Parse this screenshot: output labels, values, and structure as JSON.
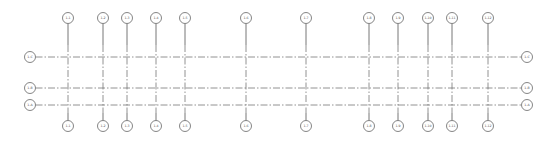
{
  "diagram": {
    "type": "structural-grid-plan",
    "colors": {
      "line": "#777777",
      "bubble_stroke": "#666666",
      "text": "#555555",
      "background": "#ffffff"
    },
    "vertical_grids": [
      {
        "label": "1-1",
        "x": 68
      },
      {
        "label": "1-2",
        "x": 103
      },
      {
        "label": "1-3",
        "x": 127
      },
      {
        "label": "1-4",
        "x": 156
      },
      {
        "label": "1-5",
        "x": 185
      },
      {
        "label": "1-6",
        "x": 246
      },
      {
        "label": "1-7",
        "x": 306
      },
      {
        "label": "1-8",
        "x": 369
      },
      {
        "label": "1-9",
        "x": 398
      },
      {
        "label": "1-10",
        "x": 428
      },
      {
        "label": "1-11",
        "x": 452
      },
      {
        "label": "1-12",
        "x": 488
      }
    ],
    "horizontal_grids": [
      {
        "label": "1-C",
        "y": 57
      },
      {
        "label": "1-B",
        "y": 88
      },
      {
        "label": "1-A",
        "y": 105
      }
    ],
    "bubble_positions": {
      "top_y": 18,
      "bottom_y": 126,
      "left_x": 30,
      "right_x": 527,
      "radius": 5.5
    }
  }
}
